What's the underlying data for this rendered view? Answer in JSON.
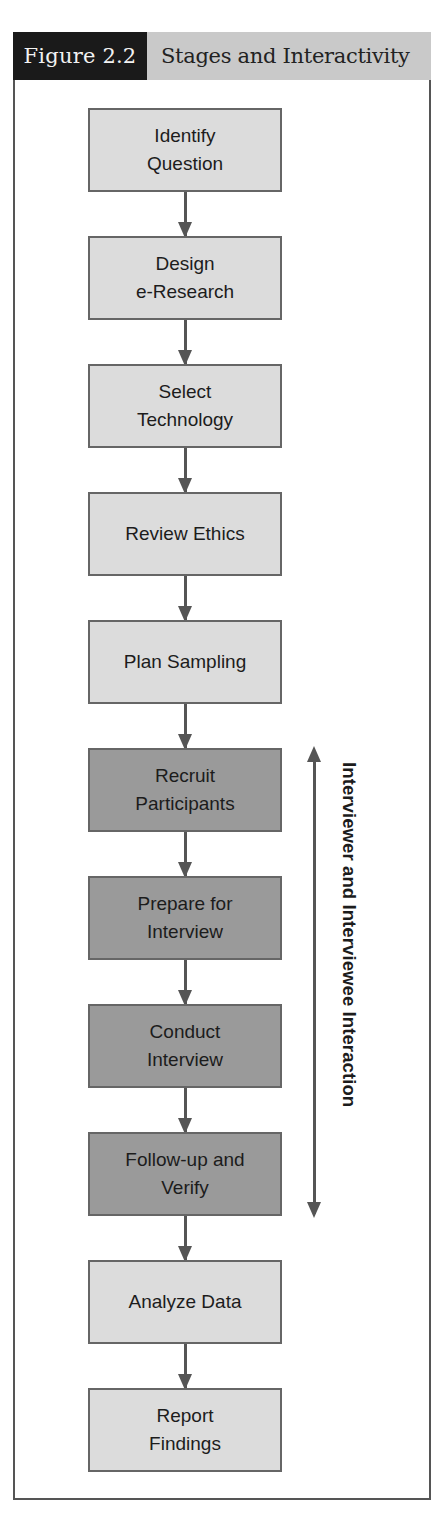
{
  "figure": {
    "number": "Figure 2.2",
    "title": "Stages and Interactivity"
  },
  "colors": {
    "light_box": "#dcdcdc",
    "dark_box": "#9a9a9a",
    "header_dark": "#1a1a1a",
    "header_light": "#c9c9c9",
    "arrow": "#555555"
  },
  "stages": [
    {
      "label": "Identify\nQuestion",
      "shade": "light"
    },
    {
      "label": "Design\ne-Research",
      "shade": "light"
    },
    {
      "label": "Select\nTechnology",
      "shade": "light"
    },
    {
      "label": "Review Ethics",
      "shade": "light"
    },
    {
      "label": "Plan Sampling",
      "shade": "light"
    },
    {
      "label": "Recruit\nParticipants",
      "shade": "dark"
    },
    {
      "label": "Prepare for\nInterview",
      "shade": "dark"
    },
    {
      "label": "Conduct\nInterview",
      "shade": "dark"
    },
    {
      "label": "Follow-up and\nVerify",
      "shade": "dark"
    },
    {
      "label": "Analyze Data",
      "shade": "light"
    },
    {
      "label": "Report\nFindings",
      "shade": "light"
    }
  ],
  "interaction_span": {
    "label": "Interviewer and Interviewee Interaction",
    "from_stage": "Recruit Participants",
    "to_stage": "Follow-up and Verify"
  }
}
